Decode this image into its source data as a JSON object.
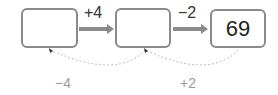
{
  "boxes": [
    {
      "value": ""
    },
    {
      "value": ""
    },
    {
      "value": "69"
    }
  ],
  "forward_ops": [
    "+4",
    "−2"
  ],
  "inverse_ops": [
    "−4",
    "+2"
  ],
  "colors": {
    "box_border": "#8a8a8a",
    "arrow": "#8a8a8a",
    "inverse_text": "#9a9a9a",
    "dotted_arc": "#bbbbbb"
  }
}
